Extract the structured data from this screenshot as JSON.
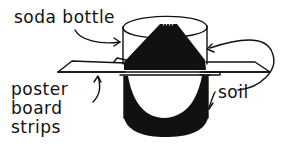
{
  "diagram": {
    "colors": {
      "ink": "#111111",
      "background": "#ffffff"
    },
    "labels": {
      "soda_bottle": "soda bottle",
      "poster_board_strips": "poster\nboard\nstrips",
      "soil": "soil"
    }
  }
}
